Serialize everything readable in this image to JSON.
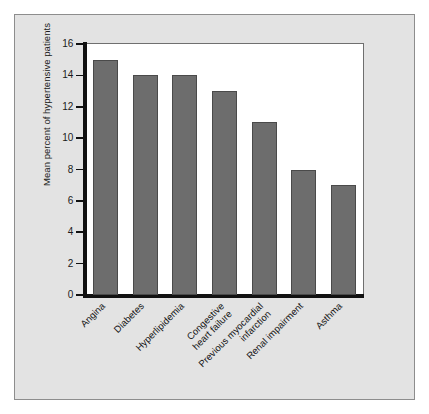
{
  "figure": {
    "background_color": "#ffffff",
    "panel_background_color": "#e3e3e3",
    "panel_border_color": "#8d8d8d",
    "plot_background_color": "#ffffff"
  },
  "chart_data": {
    "type": "bar",
    "title": "",
    "subtitle": "",
    "xlabel": "",
    "ylabel": "Mean percent of hypertensive patients",
    "categories": [
      "Angina",
      "Diabetes",
      "Hyperlipidemia",
      "Congestive\nheart failure",
      "Previous myocardial\ninfarction",
      "Renal impairment",
      "Asthma"
    ],
    "values": [
      15,
      14,
      14,
      13,
      11,
      8,
      7
    ],
    "ylim": [
      0,
      16
    ],
    "yticks": [
      0,
      2,
      4,
      6,
      8,
      10,
      12,
      14,
      16
    ],
    "ytick_labels": [
      "0",
      "2",
      "4",
      "6",
      "8",
      "10",
      "12",
      "14",
      "16"
    ],
    "grid": false,
    "legend": null,
    "bar_color": "#6d6d6d",
    "bar_edge_color": "#4a4a4a",
    "axis_color": "#111111",
    "xtick_label_rotation": -45
  }
}
